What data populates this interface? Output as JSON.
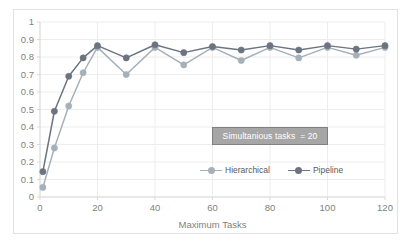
{
  "chart_data": {
    "type": "line",
    "title": "",
    "subtitle": "",
    "xlabel": "Maximum Tasks",
    "ylabel": "",
    "xlim": [
      0,
      120
    ],
    "ylim": [
      0,
      1
    ],
    "x_ticks": [
      0,
      20,
      40,
      60,
      80,
      100,
      120
    ],
    "x_tick_labels": [
      "0",
      "20",
      "40",
      "60",
      "80",
      "100",
      "120"
    ],
    "y_ticks": [
      0,
      0.1,
      0.2,
      0.3,
      0.4,
      0.5,
      0.6,
      0.7,
      0.8,
      0.9,
      1
    ],
    "y_tick_labels": [
      "0",
      "0.1",
      "0.2",
      "0.3",
      "0.4",
      "0.5",
      "0.6",
      "0.7",
      "0.8",
      "0.9",
      "1"
    ],
    "grid": true,
    "grid_axis": "both",
    "legend_position": "inside-center-right",
    "x": [
      1,
      5,
      10,
      15,
      20,
      30,
      40,
      50,
      60,
      70,
      80,
      90,
      100,
      110,
      120
    ],
    "series": [
      {
        "name": "Hierarchical",
        "color": "#a6b0b8",
        "marker": "circle",
        "values": [
          0.055,
          0.28,
          0.52,
          0.71,
          0.855,
          0.7,
          0.855,
          0.755,
          0.855,
          0.78,
          0.855,
          0.795,
          0.855,
          0.81,
          0.855
        ]
      },
      {
        "name": "Pipeline",
        "color": "#6b7480",
        "marker": "circle",
        "values": [
          0.145,
          0.49,
          0.69,
          0.795,
          0.865,
          0.795,
          0.87,
          0.825,
          0.86,
          0.84,
          0.865,
          0.84,
          0.865,
          0.845,
          0.865
        ]
      }
    ],
    "annotations": [
      {
        "text": "Simultanious tasks  = 20",
        "x": 62,
        "y": 0.37,
        "fill_color": "#a6a6a6",
        "border_color": "#808080",
        "text_color": "#ffffff"
      }
    ]
  },
  "axis": {
    "x_title": "Maximum Tasks"
  },
  "annotation": {
    "label": "Simultanious tasks  = 20"
  },
  "legend": {
    "items": [
      {
        "label": "Hierarchical"
      },
      {
        "label": "Pipeline"
      }
    ]
  },
  "colors": {
    "hierarchical": "#a6b0b8",
    "pipeline": "#6b7480",
    "grid": "#ededed",
    "axis": "#d9d9d9",
    "tick_text": "#7f7f7f",
    "frame": "#e2e2e2",
    "background": "#ffffff"
  }
}
